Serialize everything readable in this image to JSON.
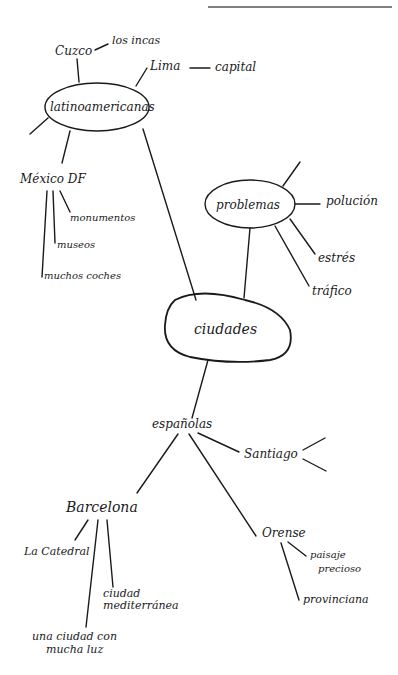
{
  "header": {
    "rule_color": "#555555",
    "cut_text": ""
  },
  "mindmap": {
    "center": {
      "label": "ciudades"
    },
    "branches": {
      "latinoamericanas": {
        "label": "latinoamericanas",
        "children": {
          "cuzco": {
            "label": "Cuzco",
            "detail": "los incas"
          },
          "lima": {
            "label": "Lima",
            "detail": "capital"
          },
          "mexico": {
            "label": "México DF",
            "details": [
              "monumentos",
              "museos",
              "muchos coches"
            ]
          }
        }
      },
      "problemas": {
        "label": "problemas",
        "children": [
          "polución",
          "estrés",
          "tráfico"
        ]
      },
      "espanolas": {
        "label": "españolas",
        "children": {
          "santiago": {
            "label": "Santiago"
          },
          "barcelona": {
            "label": "Barcelona",
            "details": [
              "La Catedral",
              "ciudad",
              "mediterránea",
              "una ciudad con",
              "mucha luz"
            ]
          },
          "orense": {
            "label": "Orense",
            "details": [
              "paisaje",
              "precioso",
              "provinciana"
            ]
          }
        }
      }
    }
  }
}
